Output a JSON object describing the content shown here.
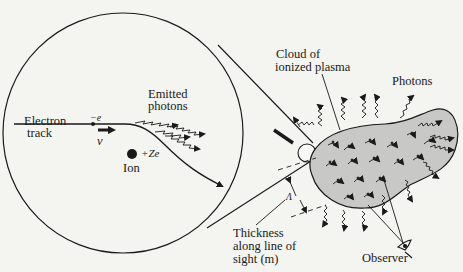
{
  "diagram": {
    "labels": {
      "electron_track_1": "Electron",
      "electron_track_2": "track",
      "electron_charge": "−e",
      "velocity": "v",
      "ion_charge": "+Ze",
      "ion": "Ion",
      "emitted_photons_1": "Emitted",
      "emitted_photons_2": "photons",
      "cloud_1": "Cloud of",
      "cloud_2": "ionized plasma",
      "photons": "Photons",
      "thickness_symbol": "Λ",
      "thickness_1": "Thickness",
      "thickness_2": "along line of",
      "thickness_3": "sight  (m)",
      "observer": "Observer"
    },
    "colors": {
      "ink": "#1a1a1a",
      "plasma_fill": "#c8c8c6",
      "background": "#f4f4f1"
    }
  }
}
